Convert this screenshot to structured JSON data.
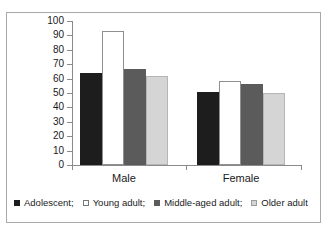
{
  "chart_data": {
    "type": "bar",
    "title": "",
    "xlabel": "",
    "ylabel": "Percent",
    "ylim": [
      0,
      100
    ],
    "ytick_step": 10,
    "yticks": [
      100,
      90,
      80,
      70,
      60,
      50,
      40,
      30,
      20,
      10,
      0
    ],
    "categories": [
      "Male",
      "Female"
    ],
    "grid": false,
    "legend_position": "bottom",
    "series": [
      {
        "name": "Adolescent;",
        "color": "#1d1d1d",
        "swatch": "black",
        "values": [
          64,
          51
        ]
      },
      {
        "name": "Young adult;",
        "color": "#ffffff",
        "swatch": "white",
        "values": [
          93,
          58
        ]
      },
      {
        "name": "Middle-aged adult;",
        "color": "#5b5b5b",
        "swatch": "darkgray",
        "values": [
          67,
          56
        ]
      },
      {
        "name": "Older adult",
        "color": "#d5d5d5",
        "swatch": "lightgray",
        "values": [
          62,
          50
        ]
      }
    ]
  },
  "axis": {
    "y_label": "Percent",
    "tick_labels": [
      "100",
      "90",
      "80",
      "70",
      "60",
      "50",
      "40",
      "30",
      "20",
      "10",
      "0"
    ],
    "category_labels": [
      "Male",
      "Female"
    ]
  },
  "legend": {
    "items": [
      {
        "label": "Adolescent;",
        "swatch": "black"
      },
      {
        "label": "Young adult;",
        "swatch": "white"
      },
      {
        "label": "Middle-aged adult;",
        "swatch": "darkgray"
      },
      {
        "label": "Older adult",
        "swatch": "lightgray"
      }
    ]
  }
}
